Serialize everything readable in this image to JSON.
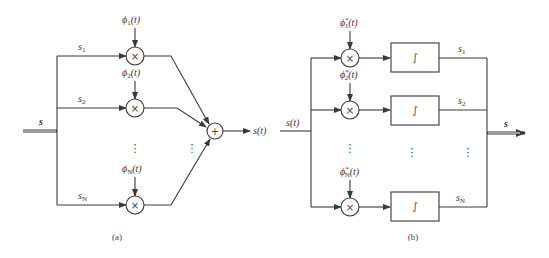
{
  "diagram_a": {
    "caption": "(a)",
    "input_label": "s",
    "branches": [
      {
        "coef": "s",
        "coef_sub": "1",
        "basis": "ϕ",
        "basis_sub": "1",
        "basis_arg": "(t)",
        "op": "×"
      },
      {
        "coef": "s",
        "coef_sub": "2",
        "basis": "ϕ",
        "basis_sub": "2",
        "basis_arg": "(t)",
        "op": "×"
      },
      {
        "coef": "s",
        "coef_sub": "N",
        "basis": "ϕ",
        "basis_sub": "N",
        "basis_arg": "(t)",
        "op": "×"
      }
    ],
    "summer_op": "+",
    "output_label": "s(t)",
    "ellipsis": "⋮"
  },
  "diagram_b": {
    "caption": "(b)",
    "input_label": "s(t)",
    "branches": [
      {
        "basis": "ϕ",
        "basis_sub": "1",
        "basis_sup": "*",
        "basis_arg": "(t)",
        "op": "×",
        "block": "∫",
        "out": "s",
        "out_sub": "1"
      },
      {
        "basis": "ϕ",
        "basis_sub": "2",
        "basis_sup": "*",
        "basis_arg": "(t)",
        "op": "×",
        "block": "∫",
        "out": "s",
        "out_sub": "2"
      },
      {
        "basis": "ϕ",
        "basis_sub": "N",
        "basis_sup": "*",
        "basis_arg": "(t)",
        "op": "×",
        "block": "∫",
        "out": "s",
        "out_sub": "N"
      }
    ],
    "output_label": "s",
    "ellipsis": "⋮"
  }
}
